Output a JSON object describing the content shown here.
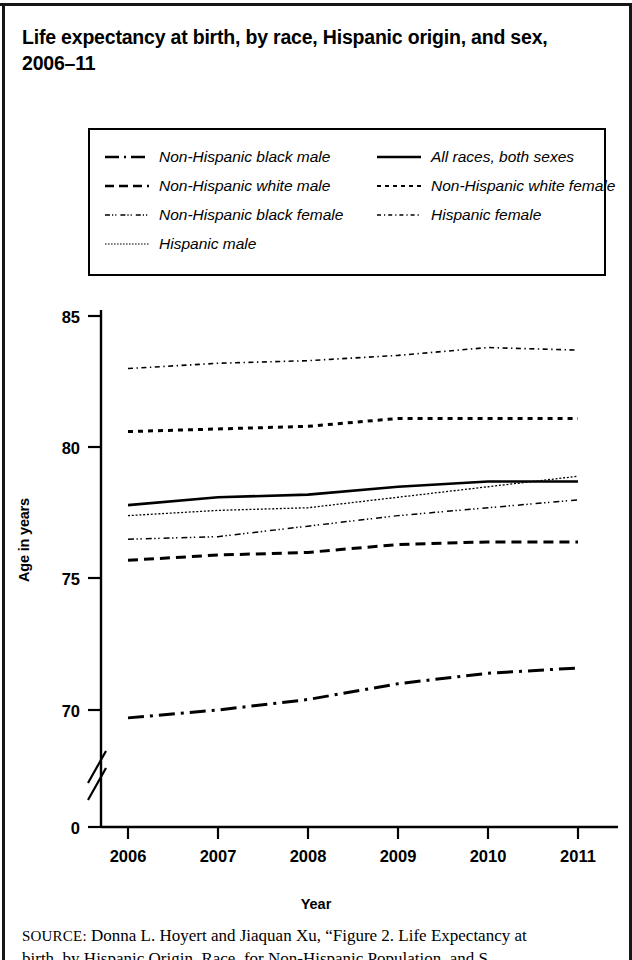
{
  "title": "Life expectancy at birth, by race, Hispanic origin, and sex, 2006–11",
  "legend": {
    "left_column": [
      {
        "label": "Non-Hispanic black male",
        "style": "dash-dot"
      },
      {
        "label": "Non-Hispanic white male",
        "style": "dashed"
      },
      {
        "label": "Non-Hispanic black female",
        "style": "dash-dot-dot-fine"
      },
      {
        "label": "Hispanic male",
        "style": "fine-dotted"
      }
    ],
    "right_column": [
      {
        "label": "All races, both sexes",
        "style": "solid"
      },
      {
        "label": "Non-Hispanic white female",
        "style": "dotted"
      },
      {
        "label": "Hispanic female",
        "style": "fine-dash-dot"
      }
    ]
  },
  "axes": {
    "y_title": "Age in years",
    "x_title": "Year",
    "y_ticks": [
      "0",
      "70",
      "75",
      "80",
      "85"
    ],
    "x_ticks": [
      "2006",
      "2007",
      "2008",
      "2009",
      "2010",
      "2011"
    ],
    "y_axis_break": true
  },
  "source": {
    "kicker": "SOURCE:",
    "line1": " Donna L. Hoyert and Jiaquan Xu, “Figure 2. Life Expectancy at",
    "line2": "birth, by Hispanic Origin, Race, for Non-Hispanic Population, and S"
  },
  "colors": {
    "ink": "#000000",
    "paper": "#ffffff"
  },
  "chart_data": {
    "type": "line",
    "title": "Life expectancy at birth, by race, Hispanic origin, and sex, 2006–11",
    "xlabel": "Year",
    "ylabel": "Age in years",
    "x": [
      2006,
      2007,
      2008,
      2009,
      2010,
      2011
    ],
    "ylim": [
      70,
      85
    ],
    "y_ticks": [
      70,
      75,
      80,
      85
    ],
    "y_axis_break_below": 70,
    "grid": false,
    "legend_position": "top",
    "series": [
      {
        "name": "Hispanic female",
        "style": "fine-dash-dot",
        "values": [
          83.0,
          83.2,
          83.3,
          83.5,
          83.8,
          83.7
        ]
      },
      {
        "name": "Non-Hispanic white female",
        "style": "dotted",
        "values": [
          80.6,
          80.7,
          80.8,
          81.1,
          81.1,
          81.1
        ]
      },
      {
        "name": "Non-Hispanic black female",
        "style": "dash-dot-dot-fine",
        "values": [
          76.5,
          76.6,
          77.0,
          77.4,
          77.7,
          78.0
        ]
      },
      {
        "name": "All races, both sexes",
        "style": "solid",
        "values": [
          77.8,
          78.1,
          78.2,
          78.5,
          78.7,
          78.7
        ]
      },
      {
        "name": "Hispanic male",
        "style": "fine-dotted",
        "values": [
          77.4,
          77.6,
          77.7,
          78.1,
          78.5,
          78.9
        ]
      },
      {
        "name": "Non-Hispanic white male",
        "style": "dashed",
        "values": [
          75.7,
          75.9,
          76.0,
          76.3,
          76.4,
          76.4
        ]
      },
      {
        "name": "Non-Hispanic black male",
        "style": "dash-dot",
        "values": [
          69.7,
          70.0,
          70.4,
          71.0,
          71.4,
          71.6
        ]
      }
    ]
  }
}
